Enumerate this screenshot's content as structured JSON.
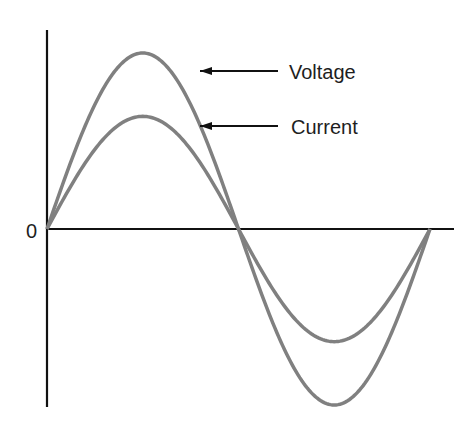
{
  "chart_data": {
    "type": "line",
    "title": "",
    "xlabel": "",
    "ylabel": "",
    "origin_label": "0",
    "x": [
      0,
      45,
      90,
      135,
      180,
      225,
      270,
      315,
      360
    ],
    "series": [
      {
        "name": "Voltage",
        "values": [
          0,
          0.71,
          1.0,
          0.71,
          0,
          -0.71,
          -1.0,
          -0.71,
          0
        ],
        "amplitude": 1.0
      },
      {
        "name": "Current",
        "values": [
          0,
          0.45,
          0.64,
          0.45,
          0,
          -0.45,
          -0.64,
          -0.45,
          0
        ],
        "amplitude": 0.64
      }
    ],
    "annotations": [
      "Voltage",
      "Current"
    ],
    "grid": false,
    "legend": "arrow-labels"
  },
  "labels": {
    "origin": "0",
    "voltage": "Voltage",
    "current": "Current"
  },
  "colors": {
    "curve": "#808080",
    "axis": "#111111",
    "text": "#1e1e1e"
  }
}
